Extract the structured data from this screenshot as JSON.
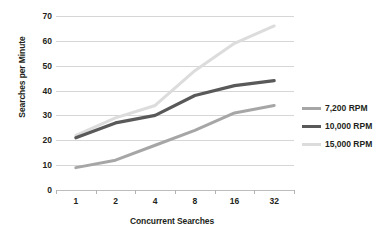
{
  "chart_data": {
    "type": "line",
    "title": "",
    "xlabel": "Concurrent Searches",
    "ylabel": "Searches per Minute",
    "categories": [
      "1",
      "2",
      "4",
      "8",
      "16",
      "32"
    ],
    "yticks": [
      "0",
      "10",
      "20",
      "30",
      "40",
      "50",
      "60",
      "70"
    ],
    "ylim": [
      0,
      70
    ],
    "grid": "horizontal",
    "legend_position": "right",
    "series": [
      {
        "name": "7,200 RPM",
        "color": "#a6a6a6",
        "values": [
          9,
          12,
          18,
          24,
          31,
          34
        ]
      },
      {
        "name": "10,000 RPM",
        "color": "#595959",
        "values": [
          21,
          27,
          30,
          38,
          42,
          44
        ]
      },
      {
        "name": "15,000 RPM",
        "color": "#dcdcdc",
        "values": [
          22,
          29,
          34,
          48,
          59,
          66
        ]
      }
    ]
  }
}
